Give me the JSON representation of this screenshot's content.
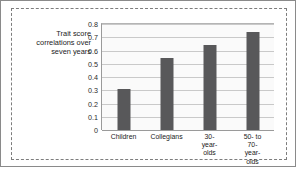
{
  "figure": {
    "axis_caption": "Trait score\ncorrelations over\nseven years"
  },
  "chart_data": {
    "type": "bar",
    "title": "",
    "xlabel": "",
    "ylabel": "Trait score correlations over seven years",
    "categories": [
      "Children",
      "Collegians",
      "30-year-\nolds",
      "50- to\n70-year-olds"
    ],
    "values": [
      0.31,
      0.54,
      0.64,
      0.74
    ],
    "ylim": [
      0,
      0.8
    ],
    "yticks": [
      "0",
      "0.1",
      "0.2",
      "0.3",
      "0.4",
      "0.5",
      "0.6",
      "0.7",
      "0.8"
    ],
    "ytick_values": [
      0,
      0.1,
      0.2,
      0.3,
      0.4,
      0.5,
      0.6,
      0.7,
      0.8
    ],
    "grid": true,
    "legend": "none",
    "bar_color": "#58585a",
    "plot_background": "#fafafa",
    "gridline_color": "#c9c9c9"
  }
}
